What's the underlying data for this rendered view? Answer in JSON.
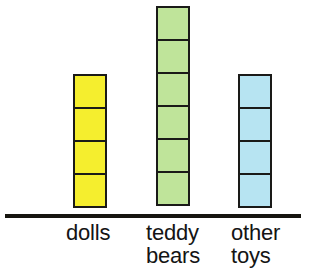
{
  "chart_data": {
    "type": "bar",
    "title": "",
    "subtitle": "",
    "xlabel": "",
    "ylabel": "",
    "grid": false,
    "legend": false,
    "unit_blocks": true,
    "note": "Pictograph-style bar chart; each bar is built of stacked unit squares.",
    "categories": [
      "dolls",
      "teddy bears",
      "other toys"
    ],
    "values": [
      4,
      6,
      4
    ],
    "ylim": [
      0,
      6
    ],
    "series": [
      {
        "name": "toys",
        "values": [
          4,
          6,
          4
        ]
      }
    ],
    "bars": [
      {
        "category": "dolls",
        "label_lines": "dolls",
        "value": 4,
        "color": "#F5EE2E",
        "outline": "#1a1a18",
        "left": 73,
        "width": 34,
        "top": 74,
        "unit_height": 35,
        "label_left": 66
      },
      {
        "category": "teddy bears",
        "label_lines": "teddy\nbears",
        "value": 6,
        "color": "#BFE49A",
        "outline": "#1a1a18",
        "left": 156,
        "width": 34,
        "top": 6,
        "unit_height": 35,
        "label_left": 146
      },
      {
        "category": "other toys",
        "label_lines": "other\ntoys",
        "value": 4,
        "color": "#B7E4F2",
        "outline": "#1a1a18",
        "left": 238,
        "width": 34,
        "top": 74,
        "unit_height": 35,
        "label_left": 231
      }
    ],
    "axis": {
      "baseline_y": 214,
      "left": 5,
      "width": 296,
      "color": "#16150f"
    }
  }
}
